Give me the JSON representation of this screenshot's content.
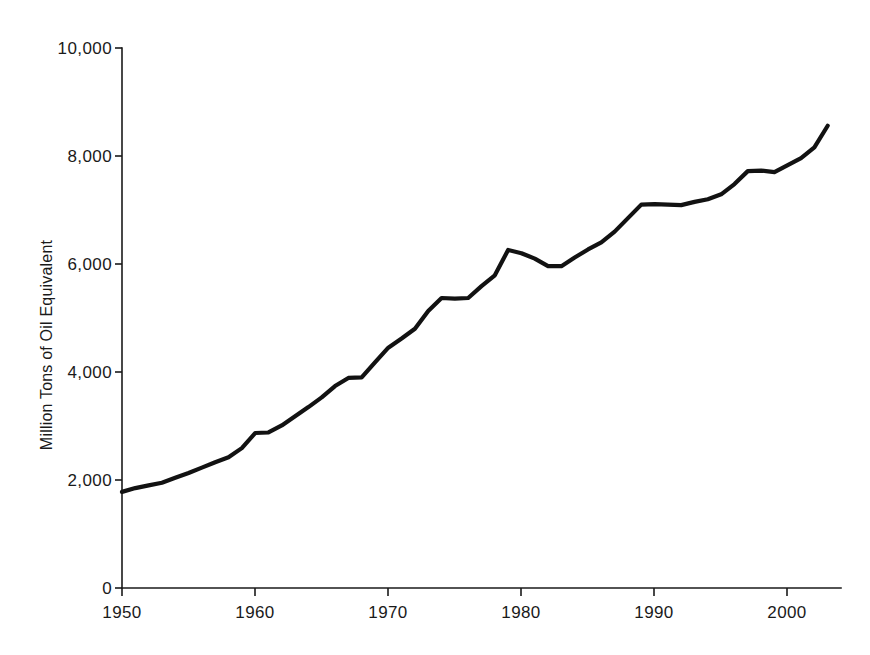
{
  "chart_data": {
    "type": "line",
    "title": "",
    "subtitle": "",
    "xlabel": "",
    "ylabel": "Million Tons of Oil Equivalent",
    "xlim": [
      1950,
      2004
    ],
    "ylim": [
      0,
      10000
    ],
    "grid": false,
    "legend": null,
    "legend_position": "none",
    "line_color": "#121212",
    "axis_color": "#1a1a1a",
    "background_color": "#ffffff",
    "x_ticks": [
      1950,
      1960,
      1970,
      1980,
      1990,
      2000
    ],
    "x_tick_labels": [
      "1950",
      "1960",
      "1970",
      "1980",
      "1990",
      "2000"
    ],
    "y_ticks": [
      0,
      2000,
      4000,
      6000,
      8000,
      10000
    ],
    "y_tick_labels": [
      "0",
      "2,000",
      "4,000",
      "6,000",
      "8,000",
      "10,000"
    ],
    "series": [
      {
        "name": "World Fossil Fuel Use",
        "x": [
          1950,
          1951,
          1952,
          1953,
          1954,
          1955,
          1956,
          1957,
          1958,
          1959,
          1960,
          1961,
          1962,
          1963,
          1964,
          1965,
          1966,
          1967,
          1968,
          1969,
          1970,
          1971,
          1972,
          1973,
          1974,
          1975,
          1976,
          1977,
          1978,
          1979,
          1980,
          1981,
          1982,
          1983,
          1984,
          1985,
          1986,
          1987,
          1988,
          1989,
          1990,
          1991,
          1992,
          1993,
          1994,
          1995,
          1996,
          1997,
          1998,
          1999,
          2000,
          2001,
          2002,
          2003
        ],
        "values": [
          1780,
          1850,
          1900,
          1950,
          2040,
          2130,
          2230,
          2330,
          2420,
          2590,
          2870,
          2880,
          3010,
          3180,
          3350,
          3530,
          3740,
          3890,
          3900,
          4180,
          4450,
          4620,
          4800,
          5130,
          5370,
          5360,
          5370,
          5590,
          5790,
          6260,
          6200,
          6100,
          5960,
          5960,
          6120,
          6270,
          6400,
          6600,
          6850,
          7100,
          7110,
          7100,
          7090,
          7150,
          7200,
          7290,
          7480,
          7720,
          7730,
          7700,
          7830,
          7960,
          8160,
          8560
        ]
      }
    ]
  },
  "axes": {
    "y_axis_title": "Million Tons of Oil Equivalent"
  }
}
